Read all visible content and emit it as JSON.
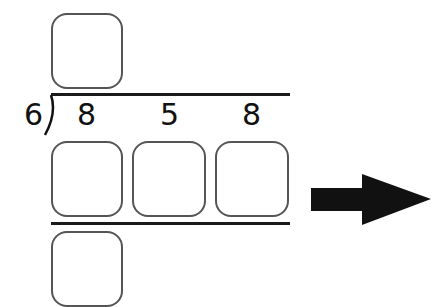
{
  "problem": {
    "divisor": "6",
    "dividend_digits": [
      "8",
      "5",
      "8"
    ],
    "quotient_boxes": 1,
    "product_boxes": 3,
    "remainder_boxes": 1
  },
  "icons": {
    "next": "right-arrow-icon"
  },
  "colors": {
    "box_border": "#555555",
    "line": "#1a1a1a",
    "arrow": "#111111"
  }
}
